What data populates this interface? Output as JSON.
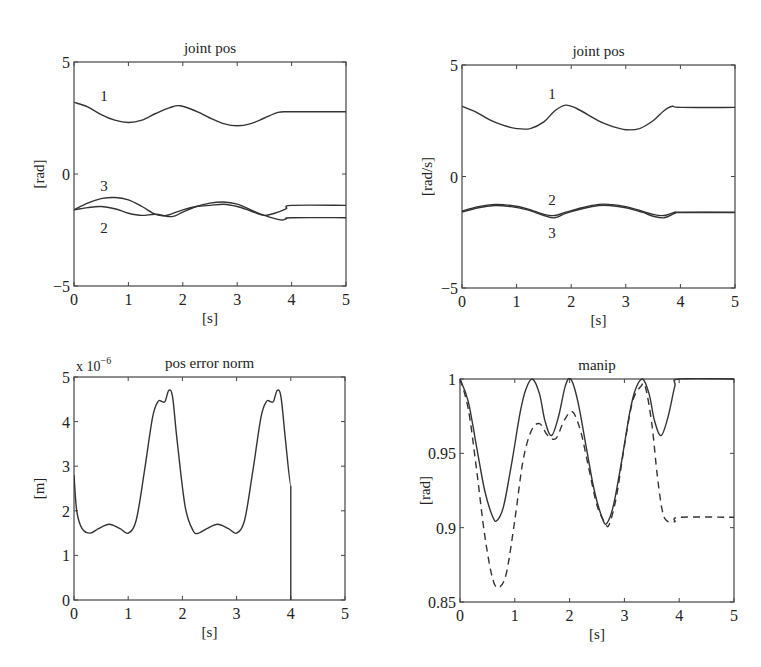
{
  "figure": {
    "background": "#ffffff",
    "line_color": "#333333",
    "axis_color": "#444444"
  },
  "chart_data": [
    {
      "id": "joint-pos-left",
      "type": "line",
      "title": "joint pos",
      "xlabel": "[s]",
      "ylabel": "[rad]",
      "xlim": [
        0,
        5
      ],
      "ylim": [
        -5,
        5
      ],
      "xticks": [
        0,
        1,
        2,
        3,
        4,
        5
      ],
      "yticks": [
        -5,
        0,
        5
      ],
      "ytick_labels": [
        "−5",
        "0",
        "5"
      ],
      "grid": false,
      "box": {
        "left": 74,
        "top": 62,
        "right": 346,
        "bottom": 286
      },
      "annotations": [
        {
          "text": "1",
          "x": 0.55,
          "y": 3.5
        },
        {
          "text": "3",
          "x": 0.55,
          "y": -0.55
        },
        {
          "text": "2",
          "x": 0.55,
          "y": -2.4
        }
      ],
      "series": [
        {
          "name": "1",
          "style": "solid",
          "x": [
            0,
            0.25,
            0.5,
            0.75,
            1.0,
            1.25,
            1.5,
            1.75,
            1.95,
            2.25,
            2.5,
            2.75,
            3.0,
            3.25,
            3.5,
            3.75,
            3.9,
            4.0,
            5.0
          ],
          "y": [
            3.2,
            3.0,
            2.65,
            2.4,
            2.3,
            2.4,
            2.7,
            2.95,
            3.05,
            2.8,
            2.5,
            2.25,
            2.15,
            2.25,
            2.5,
            2.75,
            2.78,
            2.78,
            2.78
          ]
        },
        {
          "name": "3",
          "style": "solid",
          "x": [
            0,
            0.25,
            0.5,
            0.75,
            1.0,
            1.25,
            1.5,
            1.7,
            2.0,
            2.25,
            2.5,
            2.75,
            3.0,
            3.25,
            3.5,
            3.75,
            3.9,
            4.0,
            5.0
          ],
          "y": [
            -1.6,
            -1.3,
            -1.1,
            -1.05,
            -1.15,
            -1.45,
            -1.8,
            -1.85,
            -1.6,
            -1.45,
            -1.4,
            -1.35,
            -1.45,
            -1.65,
            -1.85,
            -1.7,
            -1.55,
            -1.4,
            -1.4
          ]
        },
        {
          "name": "2",
          "style": "solid",
          "x": [
            0,
            0.25,
            0.5,
            0.75,
            1.0,
            1.25,
            1.5,
            1.8,
            2.0,
            2.25,
            2.5,
            2.75,
            3.0,
            3.25,
            3.5,
            3.8,
            3.9,
            4.0,
            5.0
          ],
          "y": [
            -1.6,
            -1.5,
            -1.45,
            -1.55,
            -1.75,
            -1.85,
            -1.8,
            -1.9,
            -1.7,
            -1.45,
            -1.3,
            -1.25,
            -1.35,
            -1.6,
            -1.85,
            -2.05,
            -2.0,
            -1.95,
            -1.95
          ]
        }
      ]
    },
    {
      "id": "joint-pos-right",
      "type": "line",
      "title": "joint pos",
      "xlabel": "[s]",
      "ylabel": "[rad/s]",
      "xlim": [
        0,
        5
      ],
      "ylim": [
        -5,
        5
      ],
      "xticks": [
        0,
        1,
        2,
        3,
        4,
        5
      ],
      "yticks": [
        -5,
        0,
        5
      ],
      "ytick_labels": [
        "−5",
        "0",
        "5"
      ],
      "grid": false,
      "box": {
        "left": 462,
        "top": 65,
        "right": 735,
        "bottom": 288
      },
      "annotations": [
        {
          "text": "1",
          "x": 1.65,
          "y": 3.7
        },
        {
          "text": "2",
          "x": 1.65,
          "y": -1.05
        },
        {
          "text": "3",
          "x": 1.65,
          "y": -2.55
        }
      ],
      "series": [
        {
          "name": "1",
          "style": "solid",
          "x": [
            0,
            0.25,
            0.5,
            0.75,
            1.0,
            1.25,
            1.5,
            1.7,
            1.9,
            2.1,
            2.5,
            2.75,
            3.0,
            3.25,
            3.5,
            3.7,
            3.85,
            4.0,
            5.0
          ],
          "y": [
            3.15,
            2.9,
            2.55,
            2.3,
            2.15,
            2.15,
            2.45,
            2.95,
            3.2,
            3.05,
            2.5,
            2.25,
            2.1,
            2.15,
            2.5,
            2.95,
            3.15,
            3.1,
            3.1
          ]
        },
        {
          "name": "2",
          "style": "solid",
          "x": [
            0,
            0.3,
            0.6,
            0.9,
            1.2,
            1.5,
            1.7,
            1.9,
            2.2,
            2.5,
            2.7,
            3.0,
            3.3,
            3.5,
            3.7,
            3.9,
            4.0,
            5.0
          ],
          "y": [
            -1.55,
            -1.35,
            -1.25,
            -1.3,
            -1.45,
            -1.7,
            -1.75,
            -1.6,
            -1.4,
            -1.25,
            -1.25,
            -1.35,
            -1.55,
            -1.7,
            -1.75,
            -1.6,
            -1.6,
            -1.6
          ]
        },
        {
          "name": "3",
          "style": "solid",
          "x": [
            0,
            0.3,
            0.6,
            0.9,
            1.2,
            1.5,
            1.7,
            1.9,
            2.2,
            2.5,
            2.7,
            3.0,
            3.3,
            3.5,
            3.7,
            3.9,
            4.0,
            5.0
          ],
          "y": [
            -1.6,
            -1.4,
            -1.3,
            -1.35,
            -1.5,
            -1.75,
            -1.85,
            -1.65,
            -1.45,
            -1.3,
            -1.3,
            -1.4,
            -1.6,
            -1.78,
            -1.85,
            -1.65,
            -1.62,
            -1.62
          ]
        }
      ]
    },
    {
      "id": "pos-error-norm",
      "type": "line",
      "title": "pos error norm",
      "xlabel": "[s]",
      "ylabel": "[m]",
      "y_multiplier_label": "x 10",
      "y_multiplier_exp": "−6",
      "xlim": [
        0,
        5
      ],
      "ylim": [
        0,
        5
      ],
      "xticks": [
        0,
        1,
        2,
        3,
        4,
        5
      ],
      "yticks": [
        0,
        1,
        2,
        3,
        4,
        5
      ],
      "ytick_labels": [
        "0",
        "1",
        "2",
        "3",
        "4",
        "5"
      ],
      "grid": false,
      "box": {
        "left": 74,
        "top": 377,
        "right": 345,
        "bottom": 600
      },
      "annotations": [],
      "series": [
        {
          "name": "error norm",
          "style": "solid",
          "x": [
            0,
            0.05,
            0.15,
            0.3,
            0.45,
            0.65,
            0.85,
            1.0,
            1.15,
            1.3,
            1.45,
            1.55,
            1.62,
            1.68,
            1.75,
            1.82,
            1.9,
            2.05,
            2.2,
            2.3,
            2.45,
            2.65,
            2.85,
            3.0,
            3.15,
            3.3,
            3.45,
            3.55,
            3.62,
            3.68,
            3.75,
            3.82,
            3.9,
            4.0,
            4.0
          ],
          "y": [
            2.8,
            2.0,
            1.6,
            1.5,
            1.6,
            1.7,
            1.6,
            1.5,
            1.8,
            2.9,
            4.1,
            4.45,
            4.45,
            4.45,
            4.7,
            4.55,
            3.6,
            2.1,
            1.55,
            1.5,
            1.6,
            1.7,
            1.6,
            1.5,
            1.8,
            2.9,
            4.1,
            4.45,
            4.45,
            4.45,
            4.7,
            4.55,
            3.6,
            2.55,
            0.0
          ]
        }
      ]
    },
    {
      "id": "manip",
      "type": "line",
      "title": "manip",
      "xlabel": "[s]",
      "ylabel": "[rad]",
      "xlim": [
        0,
        5
      ],
      "ylim": [
        0.85,
        1.0
      ],
      "xticks": [
        0,
        1,
        2,
        3,
        4,
        5
      ],
      "yticks": [
        0.85,
        0.9,
        0.95,
        1.0
      ],
      "ytick_labels": [
        "0.85",
        "0.9",
        "0.95",
        "1"
      ],
      "grid": false,
      "box": {
        "left": 460,
        "top": 379,
        "right": 734,
        "bottom": 602
      },
      "annotations": [],
      "series": [
        {
          "name": "solid",
          "style": "solid",
          "x": [
            0,
            0.15,
            0.3,
            0.45,
            0.6,
            0.68,
            0.8,
            0.95,
            1.1,
            1.2,
            1.32,
            1.45,
            1.55,
            1.67,
            1.8,
            1.92,
            2.02,
            2.15,
            2.3,
            2.45,
            2.6,
            2.68,
            2.8,
            2.95,
            3.1,
            3.2,
            3.33,
            3.45,
            3.55,
            3.67,
            3.8,
            3.92,
            4.0,
            5.0
          ],
          "y": [
            1.0,
            0.985,
            0.955,
            0.925,
            0.907,
            0.905,
            0.915,
            0.945,
            0.978,
            0.993,
            1.0,
            0.99,
            0.972,
            0.962,
            0.975,
            0.995,
            1.0,
            0.985,
            0.955,
            0.925,
            0.906,
            0.903,
            0.915,
            0.945,
            0.978,
            0.993,
            1.0,
            0.99,
            0.972,
            0.962,
            0.975,
            0.995,
            1.0,
            1.0
          ]
        },
        {
          "name": "dashed",
          "style": "dashed",
          "x": [
            0,
            0.15,
            0.3,
            0.45,
            0.6,
            0.72,
            0.85,
            1.0,
            1.15,
            1.3,
            1.45,
            1.6,
            1.75,
            1.9,
            2.05,
            2.2,
            2.35,
            2.5,
            2.65,
            2.72,
            2.85,
            3.0,
            3.15,
            3.3,
            3.38,
            3.5,
            3.6,
            3.7,
            3.8,
            3.92,
            4.0,
            5.0
          ],
          "y": [
            1.0,
            0.98,
            0.94,
            0.895,
            0.865,
            0.86,
            0.87,
            0.905,
            0.945,
            0.965,
            0.97,
            0.962,
            0.96,
            0.972,
            0.978,
            0.965,
            0.94,
            0.915,
            0.903,
            0.902,
            0.92,
            0.955,
            0.985,
            0.995,
            0.995,
            0.97,
            0.935,
            0.91,
            0.904,
            0.904,
            0.907,
            0.907
          ]
        }
      ]
    }
  ]
}
